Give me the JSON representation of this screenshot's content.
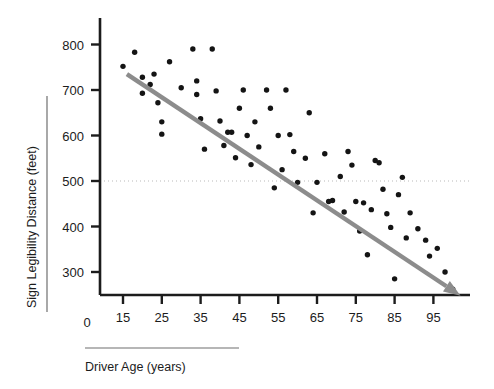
{
  "chart_data": {
    "type": "scatter",
    "title": "",
    "xlabel": "Driver Age (years)",
    "ylabel": "Sign Legibility Distance (feet)",
    "xlim": [
      10,
      102
    ],
    "ylim": [
      230,
      830
    ],
    "xticks": [
      15,
      25,
      35,
      45,
      55,
      65,
      75,
      85,
      95
    ],
    "xticklabels": [
      "15",
      "25",
      "35",
      "45",
      "55",
      "65",
      "75",
      "85",
      "95"
    ],
    "yticks": [
      300,
      400,
      500,
      600,
      700,
      800
    ],
    "yticklabels": [
      "300",
      "400",
      "500",
      "600",
      "700",
      "800"
    ],
    "origin_label": "0",
    "grid": false,
    "reference_line": {
      "orientation": "horizontal",
      "value": 500,
      "style": "dotted",
      "color": "#b9b9b9"
    },
    "trendline": {
      "label": "",
      "style": "solid-arrow",
      "color": "#8c8c8c",
      "x_start": 16,
      "y_start": 735,
      "x_end": 102,
      "y_end": 248
    },
    "point_color": "#141414",
    "points": [
      {
        "x": 15,
        "y": 752
      },
      {
        "x": 18,
        "y": 783
      },
      {
        "x": 20,
        "y": 728
      },
      {
        "x": 20,
        "y": 693
      },
      {
        "x": 22,
        "y": 712
      },
      {
        "x": 23,
        "y": 735
      },
      {
        "x": 24,
        "y": 672
      },
      {
        "x": 25,
        "y": 630
      },
      {
        "x": 25,
        "y": 603
      },
      {
        "x": 27,
        "y": 762
      },
      {
        "x": 30,
        "y": 705
      },
      {
        "x": 33,
        "y": 790
      },
      {
        "x": 34,
        "y": 720
      },
      {
        "x": 34,
        "y": 690
      },
      {
        "x": 35,
        "y": 637
      },
      {
        "x": 36,
        "y": 570
      },
      {
        "x": 38,
        "y": 790
      },
      {
        "x": 39,
        "y": 698
      },
      {
        "x": 40,
        "y": 632
      },
      {
        "x": 41,
        "y": 578
      },
      {
        "x": 42,
        "y": 607
      },
      {
        "x": 43,
        "y": 607
      },
      {
        "x": 44,
        "y": 551
      },
      {
        "x": 45,
        "y": 660
      },
      {
        "x": 46,
        "y": 700
      },
      {
        "x": 47,
        "y": 600
      },
      {
        "x": 48,
        "y": 536
      },
      {
        "x": 49,
        "y": 630
      },
      {
        "x": 50,
        "y": 575
      },
      {
        "x": 52,
        "y": 700
      },
      {
        "x": 53,
        "y": 660
      },
      {
        "x": 54,
        "y": 485
      },
      {
        "x": 55,
        "y": 600
      },
      {
        "x": 56,
        "y": 525
      },
      {
        "x": 57,
        "y": 700
      },
      {
        "x": 58,
        "y": 602
      },
      {
        "x": 59,
        "y": 565
      },
      {
        "x": 60,
        "y": 497
      },
      {
        "x": 62,
        "y": 550
      },
      {
        "x": 63,
        "y": 650
      },
      {
        "x": 64,
        "y": 430
      },
      {
        "x": 65,
        "y": 497
      },
      {
        "x": 67,
        "y": 560
      },
      {
        "x": 68,
        "y": 455
      },
      {
        "x": 69,
        "y": 457
      },
      {
        "x": 71,
        "y": 510
      },
      {
        "x": 72,
        "y": 432
      },
      {
        "x": 73,
        "y": 565
      },
      {
        "x": 74,
        "y": 535
      },
      {
        "x": 75,
        "y": 455
      },
      {
        "x": 76,
        "y": 390
      },
      {
        "x": 77,
        "y": 452
      },
      {
        "x": 78,
        "y": 338
      },
      {
        "x": 79,
        "y": 437
      },
      {
        "x": 80,
        "y": 545
      },
      {
        "x": 81,
        "y": 540
      },
      {
        "x": 82,
        "y": 482
      },
      {
        "x": 83,
        "y": 428
      },
      {
        "x": 84,
        "y": 398
      },
      {
        "x": 85,
        "y": 285
      },
      {
        "x": 86,
        "y": 470
      },
      {
        "x": 87,
        "y": 508
      },
      {
        "x": 88,
        "y": 375
      },
      {
        "x": 89,
        "y": 430
      },
      {
        "x": 91,
        "y": 395
      },
      {
        "x": 93,
        "y": 370
      },
      {
        "x": 94,
        "y": 335
      },
      {
        "x": 96,
        "y": 352
      },
      {
        "x": 98,
        "y": 300
      },
      {
        "x": 100,
        "y": 262
      }
    ]
  }
}
